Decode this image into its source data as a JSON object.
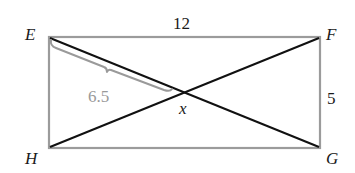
{
  "diagram": {
    "type": "rectangle-with-diagonals",
    "vertices": [
      {
        "id": "E",
        "label": "E",
        "x": 49,
        "y": 37
      },
      {
        "id": "F",
        "label": "F",
        "x": 320,
        "y": 37
      },
      {
        "id": "G",
        "label": "G",
        "x": 320,
        "y": 148
      },
      {
        "id": "H",
        "label": "H",
        "x": 49,
        "y": 148
      }
    ],
    "edges": [
      {
        "from": "E",
        "to": "F",
        "color": "#999999"
      },
      {
        "from": "F",
        "to": "G",
        "color": "#999999"
      },
      {
        "from": "G",
        "to": "H",
        "color": "#999999"
      },
      {
        "from": "H",
        "to": "E",
        "color": "#999999"
      }
    ],
    "diagonals": [
      {
        "from": "E",
        "to": "G",
        "color": "#111111"
      },
      {
        "from": "H",
        "to": "F",
        "color": "#111111"
      }
    ],
    "labels": {
      "top_side": "12",
      "right_side": "5",
      "brace_length": "6.5",
      "intersection_variable": "x"
    },
    "brace": {
      "color": "#9a9a9a",
      "from_vertex": "E",
      "to": "intersection"
    },
    "colors": {
      "rectangle": "#999999",
      "diagonal": "#111111",
      "annotation": "#9a9a9a",
      "text": "#1a1a1a"
    }
  }
}
